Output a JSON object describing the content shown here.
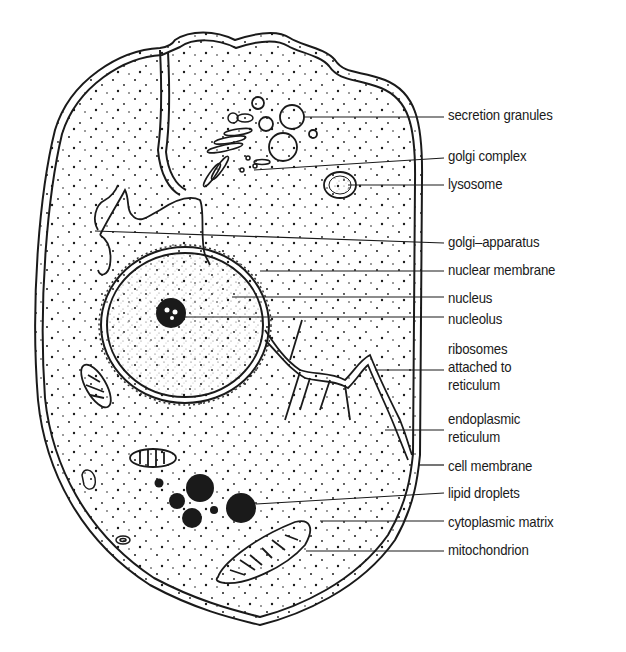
{
  "figure": {
    "colors": {
      "ink": "#1a1a1a",
      "background": "#ffffff"
    }
  },
  "labels": [
    {
      "id": "secretion-granules",
      "text": "secretion granules",
      "y": 106
    },
    {
      "id": "golgi-complex",
      "text": "golgi complex",
      "y": 147
    },
    {
      "id": "lysosome",
      "text": "lysosome",
      "y": 175
    },
    {
      "id": "golgi-apparatus",
      "text": "golgi–apparatus",
      "y": 233
    },
    {
      "id": "nuclear-membrane",
      "text": "nuclear membrane",
      "y": 261
    },
    {
      "id": "nucleus",
      "text": "nucleus",
      "y": 289
    },
    {
      "id": "nucleolus",
      "text": "nucleolus",
      "y": 310
    },
    {
      "id": "ribosomes",
      "text": "ribosomes attached to reticulum",
      "lines": [
        "ribosomes",
        "attached to",
        "reticulum"
      ],
      "y": 340
    },
    {
      "id": "endoplasmic-reticulum",
      "text": "endoplasmic reticulum",
      "lines": [
        "endoplasmic",
        "reticulum"
      ],
      "y": 410
    },
    {
      "id": "cell-membrane",
      "text": "cell membrane",
      "y": 457
    },
    {
      "id": "lipid-droplets",
      "text": "lipid droplets",
      "y": 484
    },
    {
      "id": "cytoplasmic-matrix",
      "text": "cytoplasmic matrix",
      "y": 513
    },
    {
      "id": "mitochondrion",
      "text": "mitochondrion",
      "y": 541
    }
  ]
}
